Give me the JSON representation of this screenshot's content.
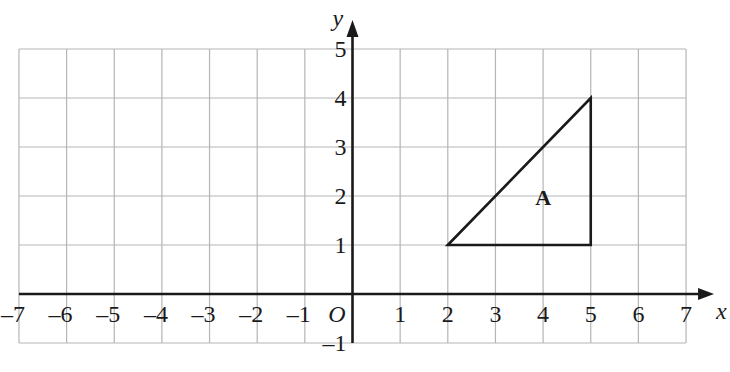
{
  "diagram": {
    "type": "coordinate-grid",
    "x_axis": {
      "label": "x",
      "min": -7,
      "max": 7,
      "ticks": [
        "-7",
        "-6",
        "-5",
        "-4",
        "-3",
        "-2",
        "-1",
        "1",
        "2",
        "3",
        "4",
        "5",
        "6",
        "7"
      ]
    },
    "y_axis": {
      "label": "y",
      "min": -1,
      "max": 5,
      "ticks": [
        "-1",
        "1",
        "2",
        "3",
        "4",
        "5"
      ]
    },
    "origin_label": "O",
    "shapes": [
      {
        "name": "A",
        "type": "triangle",
        "vertices": [
          [
            2,
            1
          ],
          [
            5,
            4
          ],
          [
            5,
            1
          ]
        ],
        "label_position": [
          4,
          2
        ]
      }
    ],
    "colors": {
      "grid": "#b5b5b5",
      "axis": "#1a1a1a",
      "shape": "#1a1a1a",
      "background": "#ffffff"
    }
  }
}
